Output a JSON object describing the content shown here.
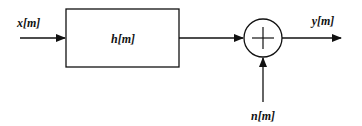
{
  "diagram": {
    "input_label": "x[m]",
    "filter_label": "h[m]",
    "output_label": "y[m]",
    "noise_label": "n[m]",
    "summer_symbol": "+",
    "colors": {
      "stroke": "#111111",
      "background": "#ffffff"
    }
  }
}
